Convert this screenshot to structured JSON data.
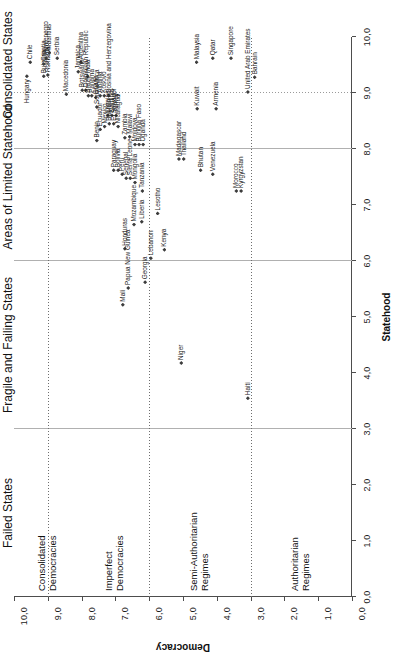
{
  "chart_data": {
    "type": "scatter",
    "title": "",
    "xlabel": "Statehood",
    "ylabel": "Democracy",
    "xlim": [
      0,
      10
    ],
    "ylim": [
      0,
      10
    ],
    "xticks": [
      "0,0",
      "1,0",
      "2,0",
      "3,0",
      "4,0",
      "5,0",
      "6,0",
      "7,0",
      "8,0",
      "9,0",
      "10,0"
    ],
    "yticks": [
      "0,0",
      "1,0",
      "2,0",
      "3,0",
      "4,0",
      "5,0",
      "6,0",
      "7,0",
      "8,0",
      "9,0",
      "10,0"
    ],
    "grid": false,
    "legend": "none",
    "reference_lines": {
      "vertical_dotted_x": [
        6.0,
        9.0
      ],
      "horizontal_solid_y": [
        3.0,
        6.0,
        9.0
      ]
    },
    "x_regions": [
      {
        "label": "Failed States",
        "range": [
          0,
          3
        ]
      },
      {
        "label": "Fragile and Failing States",
        "range": [
          3,
          6
        ]
      },
      {
        "label": "Areas of Limited Statehood",
        "range": [
          6,
          9
        ]
      },
      {
        "label": "Consolidated States",
        "range": [
          9,
          10
        ]
      }
    ],
    "y_regions": [
      {
        "label": "Authoritarian Regimes",
        "range": [
          0,
          3
        ]
      },
      {
        "label": "Semi-Authoritarian Regimes",
        "range": [
          3,
          6
        ]
      },
      {
        "label": "Imperfect Democracies",
        "range": [
          6,
          8
        ]
      },
      {
        "label": "Consolidated Democracies",
        "range": [
          8,
          10
        ]
      }
    ],
    "points": [
      {
        "name": "Hungary",
        "x": 9.3,
        "y": 9.62,
        "pos": "left"
      },
      {
        "name": "Chile",
        "x": 9.55,
        "y": 9.52,
        "pos": "right"
      },
      {
        "name": "Bulgaria",
        "x": 9.3,
        "y": 9.12,
        "pos": "right"
      },
      {
        "name": "Romania",
        "x": 9.32,
        "y": 9.0,
        "pos": "right"
      },
      {
        "name": "Croatia",
        "x": 9.52,
        "y": 9.12,
        "pos": "right"
      },
      {
        "name": "Montenegro",
        "x": 9.62,
        "y": 9.05,
        "pos": "right"
      },
      {
        "name": "Mauritius",
        "x": 9.72,
        "y": 8.95,
        "pos": "right"
      },
      {
        "name": "Serbia",
        "x": 9.62,
        "y": 8.72,
        "pos": "right"
      },
      {
        "name": "Macedonia",
        "x": 8.98,
        "y": 8.45,
        "pos": "right"
      },
      {
        "name": "Jamaica",
        "x": 9.38,
        "y": 8.1,
        "pos": "right"
      },
      {
        "name": "Argentina",
        "x": 9.55,
        "y": 8.02,
        "pos": "right"
      },
      {
        "name": "India",
        "x": 9.3,
        "y": 7.82,
        "pos": "right"
      },
      {
        "name": "Botswana",
        "x": 9.05,
        "y": 7.98,
        "pos": "right"
      },
      {
        "name": "Dominican Republic",
        "x": 9.05,
        "y": 7.88,
        "pos": "right"
      },
      {
        "name": "Brazil",
        "x": 8.95,
        "y": 7.8,
        "pos": "right"
      },
      {
        "name": "Panama",
        "x": 8.95,
        "y": 7.7,
        "pos": "right"
      },
      {
        "name": "Ghana",
        "x": 8.92,
        "y": 7.58,
        "pos": "right"
      },
      {
        "name": "Albania",
        "x": 8.95,
        "y": 7.45,
        "pos": "right"
      },
      {
        "name": "Kosovo",
        "x": 8.95,
        "y": 7.33,
        "pos": "right"
      },
      {
        "name": "Bosnia and Herzegovina",
        "x": 8.95,
        "y": 7.2,
        "pos": "right"
      },
      {
        "name": "South Africa",
        "x": 8.75,
        "y": 7.55,
        "pos": "right"
      },
      {
        "name": "Ukraine",
        "x": 8.6,
        "y": 7.22,
        "pos": "right"
      },
      {
        "name": "Namibia",
        "x": 8.6,
        "y": 7.1,
        "pos": "right"
      },
      {
        "name": "Turkey",
        "x": 8.6,
        "y": 6.98,
        "pos": "right"
      },
      {
        "name": "Benin",
        "x": 8.15,
        "y": 7.55,
        "pos": "right"
      },
      {
        "name": "Ecuador",
        "x": 8.35,
        "y": 7.45,
        "pos": "right"
      },
      {
        "name": "Mexico",
        "x": 8.4,
        "y": 7.32,
        "pos": "right"
      },
      {
        "name": "Bahrain",
        "x": 8.45,
        "y": 7.18,
        "pos": "right"
      },
      {
        "name": "El Salvador",
        "x": 8.45,
        "y": 7.05,
        "pos": "right"
      },
      {
        "name": "Nicaragua",
        "x": 8.4,
        "y": 6.92,
        "pos": "right"
      },
      {
        "name": "Paraguay",
        "x": 7.62,
        "y": 7.05,
        "pos": "right"
      },
      {
        "name": "Bolivia",
        "x": 7.62,
        "y": 6.92,
        "pos": "right"
      },
      {
        "name": "Peru",
        "x": 7.55,
        "y": 6.8,
        "pos": "right"
      },
      {
        "name": "Senegal",
        "x": 7.48,
        "y": 6.68,
        "pos": "right"
      },
      {
        "name": "Sierra Leone",
        "x": 7.48,
        "y": 6.56,
        "pos": "right"
      },
      {
        "name": "Zambia",
        "x": 8.2,
        "y": 6.72,
        "pos": "right"
      },
      {
        "name": "Malawi",
        "x": 8.22,
        "y": 6.58,
        "pos": "right"
      },
      {
        "name": "Mongolia",
        "x": 7.4,
        "y": 6.42,
        "pos": "right"
      },
      {
        "name": "Moldova",
        "x": 8.08,
        "y": 6.42,
        "pos": "right"
      },
      {
        "name": "Burkina Faso",
        "x": 8.08,
        "y": 6.3,
        "pos": "right"
      },
      {
        "name": "Uganda",
        "x": 8.08,
        "y": 6.18,
        "pos": "right"
      },
      {
        "name": "Tanzania",
        "x": 7.25,
        "y": 6.2,
        "pos": "right"
      },
      {
        "name": "Mozambique",
        "x": 6.65,
        "y": 6.45,
        "pos": "right"
      },
      {
        "name": "Liberia",
        "x": 6.7,
        "y": 6.22,
        "pos": "right"
      },
      {
        "name": "Honduras",
        "x": 6.22,
        "y": 6.72,
        "pos": "right"
      },
      {
        "name": "Lebanon",
        "x": 6.05,
        "y": 5.95,
        "pos": "right"
      },
      {
        "name": "Lesotho",
        "x": 6.85,
        "y": 5.75,
        "pos": "right"
      },
      {
        "name": "Kenya",
        "x": 6.2,
        "y": 5.55,
        "pos": "right"
      },
      {
        "name": "Papua New Guinea",
        "x": 5.52,
        "y": 6.62,
        "pos": "right"
      },
      {
        "name": "Mali",
        "x": 5.22,
        "y": 6.78,
        "pos": "right"
      },
      {
        "name": "Georgia",
        "x": 5.62,
        "y": 6.12,
        "pos": "right"
      },
      {
        "name": "Niger",
        "x": 4.18,
        "y": 5.05,
        "pos": "right"
      },
      {
        "name": "Haiti",
        "x": 3.55,
        "y": 3.08,
        "pos": "right"
      },
      {
        "name": "Madagascar",
        "x": 7.82,
        "y": 5.12,
        "pos": "right"
      },
      {
        "name": "Thailand",
        "x": 7.82,
        "y": 4.98,
        "pos": "right"
      },
      {
        "name": "Bhutan",
        "x": 7.62,
        "y": 4.48,
        "pos": "right"
      },
      {
        "name": "Venezuela",
        "x": 7.55,
        "y": 4.12,
        "pos": "right"
      },
      {
        "name": "Morocco",
        "x": 7.25,
        "y": 3.42,
        "pos": "right"
      },
      {
        "name": "Kyrgyzstan",
        "x": 7.25,
        "y": 3.28,
        "pos": "right"
      },
      {
        "name": "Kuwait",
        "x": 8.72,
        "y": 4.58,
        "pos": "right"
      },
      {
        "name": "Armenia",
        "x": 8.72,
        "y": 4.02,
        "pos": "right"
      },
      {
        "name": "United Arab Emirates",
        "x": 9.02,
        "y": 3.08,
        "pos": "right"
      },
      {
        "name": "Bahrain",
        "x": 9.28,
        "y": 2.88,
        "pos": "right"
      },
      {
        "name": "Malaysia",
        "x": 9.55,
        "y": 4.6,
        "pos": "right"
      },
      {
        "name": "Qatar",
        "x": 9.62,
        "y": 4.12,
        "pos": "right"
      },
      {
        "name": "Singapore",
        "x": 9.62,
        "y": 3.58,
        "pos": "right"
      }
    ]
  }
}
